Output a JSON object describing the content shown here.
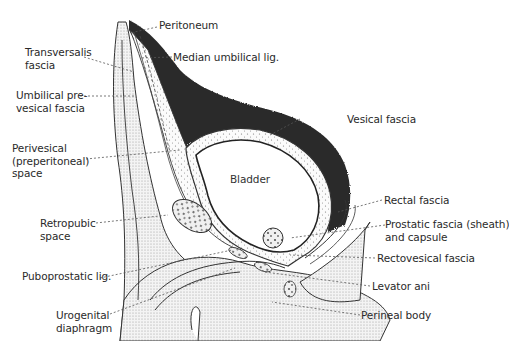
{
  "diagram": {
    "type": "anatomical-sagittal-section",
    "central_label": "Bladder",
    "colors": {
      "peritoneal_cavity": "#2b2b2b",
      "tissue_stipple": "#d8d8d8",
      "outline": "#333333",
      "leader_line": "#555555",
      "background": "#ffffff"
    },
    "labels": {
      "peritoneum": "Peritoneum",
      "median_umbilical_lig": "Median umbilical lig.",
      "transversalis_fascia": [
        "Transversalis",
        "fascia"
      ],
      "umbilical_prevesical_fascia": [
        "Umbilical pre-",
        "vesical fascia"
      ],
      "perivesical_space": [
        "Perivesical",
        "(preperitoneal)",
        "space"
      ],
      "vesical_fascia": "Vesical fascia",
      "bladder": "Bladder",
      "retropubic_space": [
        "Retropubic",
        "space"
      ],
      "puboprostatic_lig": "Puboprostatic lig.",
      "urogenital_diaphragm": [
        "Urogenital",
        "diaphragm"
      ],
      "rectal_fascia": "Rectal fascia",
      "prostatic_fascia": [
        "Prostatic fascia (sheath)",
        "and capsule"
      ],
      "rectovesical_fascia": "Rectovesical fascia",
      "levator_ani": "Levator ani",
      "perineal_body": "Perineal body"
    }
  }
}
